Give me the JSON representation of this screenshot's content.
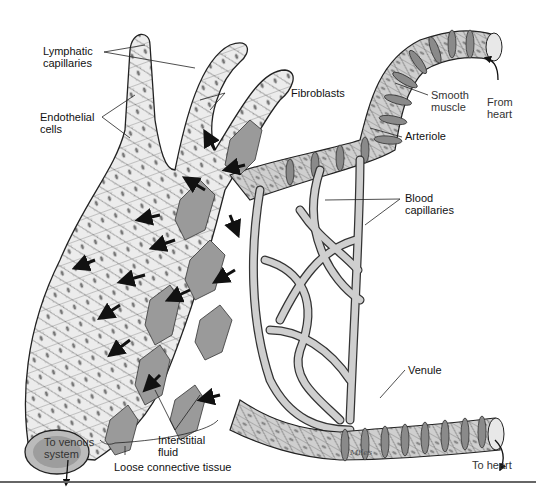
{
  "figure": {
    "labels": {
      "lymphatic_capillaries": "Lymphatic\ncapillaries",
      "endothelial_cells": "Endothelial\ncells",
      "fibroblasts": "Fibroblasts",
      "smooth_muscle": "Smooth\nmuscle",
      "from_heart": "From\nheart",
      "arteriole": "Arteriole",
      "blood_capillaries": "Blood\ncapillaries",
      "venule": "Venule",
      "to_venous_system": "To venous\nsystem",
      "interstitial_fluid": "Interstitial\nfluid",
      "loose_connective_tissue": "Loose connective tissue",
      "to_heart": "To heart",
      "signature": "Miles"
    },
    "colors": {
      "vessel_fill": "#c9c9c9",
      "vessel_stroke": "#333333",
      "muscle_band": "#8a8a8a",
      "fibroblast_fill": "#9a9a9a",
      "arrow_fill": "#111111",
      "lymph_fill": "#ececec",
      "rule": "#666666"
    }
  }
}
